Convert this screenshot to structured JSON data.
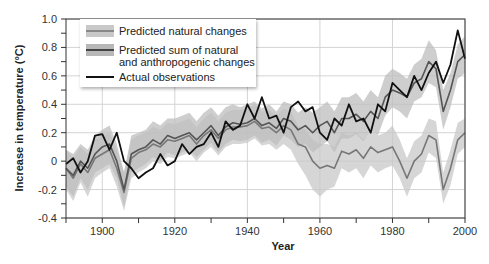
{
  "chart_data": {
    "type": "line",
    "title": "",
    "xlabel": "Year",
    "ylabel": "Increase in temperature (°C)",
    "xlim": [
      1890,
      2000
    ],
    "ylim": [
      -0.4,
      1.0
    ],
    "x_ticks": [
      "1900",
      "1920",
      "1940",
      "1960",
      "1980",
      "2000"
    ],
    "y_ticks": [
      "1.0",
      "0.8",
      "0.6",
      "0.4",
      "0.2",
      "0",
      "-0.2",
      "-0.4"
    ],
    "grid": true,
    "legend_position": "upper-left",
    "x": [
      1890,
      1892,
      1894,
      1896,
      1898,
      1900,
      1902,
      1904,
      1906,
      1908,
      1910,
      1912,
      1914,
      1916,
      1918,
      1920,
      1922,
      1924,
      1926,
      1928,
      1930,
      1932,
      1934,
      1936,
      1938,
      1940,
      1942,
      1944,
      1946,
      1948,
      1950,
      1952,
      1954,
      1956,
      1958,
      1960,
      1962,
      1964,
      1966,
      1968,
      1970,
      1972,
      1974,
      1976,
      1978,
      1980,
      1982,
      1984,
      1986,
      1988,
      1990,
      1992,
      1994,
      1996,
      1998,
      2000
    ],
    "series": [
      {
        "name": "Predicted natural changes",
        "color": "#777777",
        "band_color": "#c8c8c8",
        "values": [
          -0.05,
          -0.12,
          -0.02,
          -0.08,
          0.02,
          0.05,
          0.08,
          -0.05,
          -0.22,
          0.02,
          0.06,
          0.08,
          0.12,
          0.1,
          0.15,
          0.14,
          0.16,
          0.18,
          0.12,
          0.18,
          0.22,
          0.16,
          0.22,
          0.24,
          0.24,
          0.25,
          0.28,
          0.23,
          0.24,
          0.2,
          0.25,
          0.22,
          0.12,
          0.1,
          0.0,
          -0.05,
          -0.03,
          -0.05,
          0.07,
          0.05,
          0.08,
          0.02,
          0.1,
          0.06,
          0.08,
          0.1,
          0.0,
          -0.12,
          0.0,
          0.05,
          0.18,
          0.15,
          -0.2,
          -0.05,
          0.15,
          0.2
        ],
        "band_low": [
          -0.2,
          -0.28,
          -0.15,
          -0.25,
          -0.12,
          -0.08,
          -0.05,
          -0.18,
          -0.35,
          -0.12,
          -0.08,
          -0.05,
          0.0,
          -0.02,
          0.03,
          0.02,
          0.04,
          0.06,
          0.0,
          0.06,
          0.1,
          0.04,
          0.1,
          0.12,
          0.12,
          0.13,
          0.16,
          0.11,
          0.12,
          0.08,
          0.12,
          0.08,
          -0.02,
          -0.1,
          -0.2,
          -0.25,
          -0.2,
          -0.18,
          -0.05,
          -0.08,
          -0.05,
          -0.12,
          -0.03,
          -0.08,
          -0.05,
          -0.03,
          -0.12,
          -0.25,
          -0.12,
          -0.08,
          0.06,
          0.02,
          -0.3,
          -0.17,
          0.05,
          0.1
        ],
        "band_high": [
          0.08,
          0.02,
          0.1,
          0.05,
          0.15,
          0.18,
          0.2,
          0.08,
          -0.08,
          0.15,
          0.18,
          0.2,
          0.24,
          0.22,
          0.27,
          0.26,
          0.28,
          0.3,
          0.24,
          0.3,
          0.34,
          0.28,
          0.34,
          0.36,
          0.36,
          0.37,
          0.4,
          0.35,
          0.36,
          0.32,
          0.37,
          0.35,
          0.25,
          0.22,
          0.15,
          0.12,
          0.12,
          0.1,
          0.2,
          0.18,
          0.2,
          0.15,
          0.22,
          0.18,
          0.2,
          0.25,
          0.15,
          0.02,
          0.14,
          0.18,
          0.3,
          0.28,
          -0.08,
          0.08,
          0.27,
          0.3
        ]
      },
      {
        "name": "Predicted sum of natural and anthropogenic changes",
        "color": "#555555",
        "band_color": "#bdbdbd",
        "values": [
          -0.05,
          -0.1,
          0.0,
          -0.05,
          0.05,
          0.1,
          0.12,
          0.0,
          -0.2,
          0.05,
          0.08,
          0.1,
          0.15,
          0.12,
          0.18,
          0.16,
          0.18,
          0.2,
          0.15,
          0.2,
          0.25,
          0.18,
          0.24,
          0.27,
          0.26,
          0.27,
          0.3,
          0.25,
          0.27,
          0.23,
          0.3,
          0.28,
          0.22,
          0.25,
          0.2,
          0.25,
          0.28,
          0.2,
          0.3,
          0.3,
          0.33,
          0.28,
          0.35,
          0.3,
          0.45,
          0.5,
          0.48,
          0.45,
          0.55,
          0.58,
          0.7,
          0.65,
          0.35,
          0.5,
          0.7,
          0.75
        ],
        "band_low": [
          -0.18,
          -0.25,
          -0.12,
          -0.2,
          -0.08,
          -0.05,
          -0.02,
          -0.12,
          -0.32,
          -0.08,
          -0.05,
          -0.02,
          0.03,
          0.0,
          0.06,
          0.04,
          0.06,
          0.08,
          0.03,
          0.08,
          0.13,
          0.06,
          0.12,
          0.15,
          0.14,
          0.15,
          0.18,
          0.13,
          0.15,
          0.11,
          0.18,
          0.15,
          0.1,
          0.12,
          0.06,
          0.1,
          0.14,
          0.06,
          0.16,
          0.16,
          0.19,
          0.14,
          0.22,
          0.18,
          0.32,
          0.38,
          0.35,
          0.3,
          0.42,
          0.45,
          0.55,
          0.52,
          0.22,
          0.38,
          0.58,
          0.62
        ],
        "band_high": [
          0.08,
          0.05,
          0.12,
          0.08,
          0.18,
          0.22,
          0.25,
          0.12,
          -0.08,
          0.18,
          0.2,
          0.22,
          0.28,
          0.25,
          0.3,
          0.3,
          0.32,
          0.34,
          0.28,
          0.34,
          0.38,
          0.32,
          0.38,
          0.4,
          0.38,
          0.4,
          0.42,
          0.37,
          0.4,
          0.35,
          0.42,
          0.4,
          0.34,
          0.38,
          0.34,
          0.38,
          0.42,
          0.35,
          0.45,
          0.45,
          0.48,
          0.42,
          0.5,
          0.45,
          0.6,
          0.65,
          0.62,
          0.58,
          0.68,
          0.72,
          0.85,
          0.78,
          0.5,
          0.62,
          0.82,
          0.88
        ]
      },
      {
        "name": "Actual observations",
        "color": "#111111",
        "values": [
          -0.02,
          0.02,
          -0.08,
          0.0,
          0.18,
          0.19,
          0.08,
          0.2,
          0.0,
          -0.05,
          -0.12,
          -0.08,
          -0.05,
          0.05,
          -0.03,
          0.0,
          0.12,
          0.05,
          0.1,
          0.12,
          0.2,
          0.1,
          0.28,
          0.22,
          0.25,
          0.4,
          0.3,
          0.45,
          0.3,
          0.32,
          0.2,
          0.38,
          0.42,
          0.35,
          0.38,
          0.2,
          0.15,
          0.3,
          0.25,
          0.4,
          0.28,
          0.3,
          0.2,
          0.4,
          0.35,
          0.55,
          0.5,
          0.45,
          0.6,
          0.5,
          0.62,
          0.7,
          0.55,
          0.68,
          0.92,
          0.72
        ]
      }
    ]
  },
  "legend": {
    "items": [
      {
        "label_line1": "Predicted natural changes",
        "label_line2": ""
      },
      {
        "label_line1": "Predicted sum of natural",
        "label_line2": "and anthropogenic changes"
      },
      {
        "label_line1": "Actual observations",
        "label_line2": ""
      }
    ]
  }
}
